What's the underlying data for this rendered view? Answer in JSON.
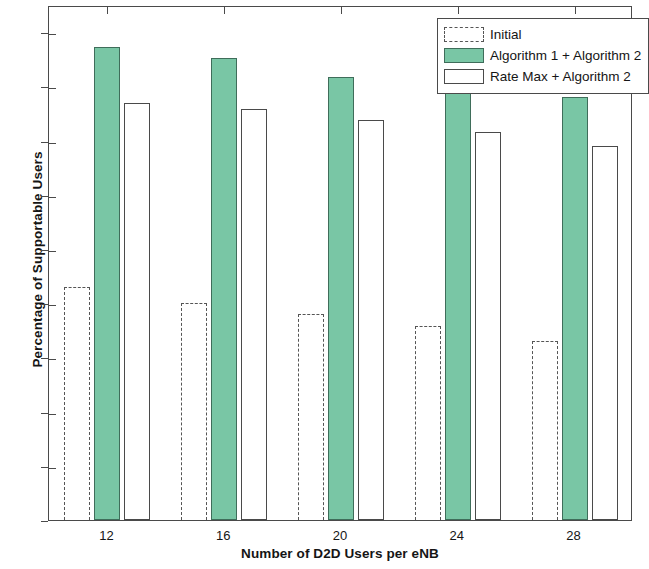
{
  "chart_data": {
    "type": "bar",
    "title": "",
    "xlabel": "Number of D2D Users per eNB",
    "ylabel": "Percentage of Supportable Users",
    "categories": [
      "12",
      "16",
      "20",
      "24",
      "28"
    ],
    "series": [
      {
        "name": "Initial",
        "style": "dashed-outline",
        "color": "#555555",
        "values": [
          0.43,
          0.4,
          0.38,
          0.358,
          0.33
        ]
      },
      {
        "name": "Algorithm 1 + Algorithm 2",
        "style": "filled",
        "color": "#79c6a5",
        "values": [
          0.873,
          0.852,
          0.817,
          0.797,
          0.78
        ]
      },
      {
        "name": "Rate Max + Algorithm 2",
        "style": "outline",
        "color": "#ffffff",
        "values": [
          0.77,
          0.758,
          0.738,
          0.715,
          0.69
        ]
      }
    ],
    "ylim": [
      0,
      0.95
    ],
    "yticks": [
      0,
      0.1,
      0.2,
      0.3,
      0.4,
      0.5,
      0.6,
      0.7,
      0.8,
      0.9
    ],
    "ytick_labels": [
      "0",
      "0.1",
      "0.2",
      "0.3",
      "0.4",
      "0.5",
      "0.6",
      "0.7",
      "0.8",
      "0.9"
    ],
    "xtick_labels": [
      "12",
      "16",
      "20",
      "24",
      "28"
    ],
    "grid": false,
    "legend_position": "top-right",
    "axis_color": "#4a4a4a",
    "background": "#ffffff"
  }
}
